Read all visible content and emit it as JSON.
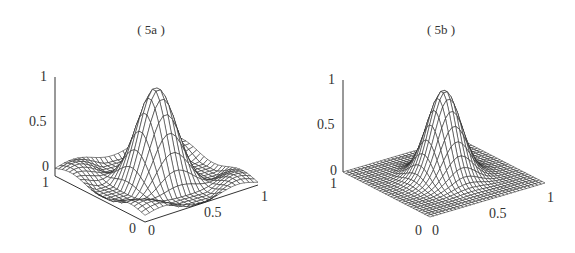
{
  "chart_data": [
    {
      "type": "surface",
      "title": "( 5a )",
      "surface": "2D sinc-like kernel: central peak of height ~0.95 at (0.5,0.5) surrounded by secondary ripple lobes (~0.3) and small oscillations near floor",
      "x_ticks": [
        "0",
        "0.5",
        "1"
      ],
      "y_ticks": [
        "0",
        "1"
      ],
      "z_ticks": [
        "0",
        "0.5",
        "1"
      ],
      "xlim": [
        0,
        1
      ],
      "ylim": [
        0,
        1
      ],
      "zlim": [
        0,
        1
      ],
      "grid_resolution": 25,
      "peak": {
        "x": 0.5,
        "y": 0.5,
        "z": 0.95
      },
      "secondary_lobe_height": 0.3
    },
    {
      "type": "surface",
      "title": "( 5b )",
      "surface": "2D Gaussian kernel: single smooth peak of height ~0.95 at (0.5,0.5), decaying to 0 at edges",
      "x_ticks": [
        "0",
        "0.5",
        "1"
      ],
      "y_ticks": [
        "0",
        "1"
      ],
      "z_ticks": [
        "0",
        "0.5",
        "1"
      ],
      "xlim": [
        0,
        1
      ],
      "ylim": [
        0,
        1
      ],
      "zlim": [
        0,
        1
      ],
      "grid_resolution": 31,
      "peak": {
        "x": 0.5,
        "y": 0.5,
        "z": 0.95
      }
    }
  ],
  "panels": {
    "a": {
      "title": "( 5a )",
      "z_labels": {
        "top": "1",
        "mid": "0.5",
        "bottom": "0"
      },
      "y_label_back": "1",
      "y_label_front": "0",
      "x_label_front": "0",
      "x_label_mid": "0.5",
      "x_label_end": "1"
    },
    "b": {
      "title": "( 5b )",
      "z_labels": {
        "top": "1",
        "mid": "0.5",
        "bottom": "0"
      },
      "y_label_back": "1",
      "y_label_front": "0",
      "x_label_front": "0",
      "x_label_mid": "0.5",
      "x_label_end": "1"
    }
  }
}
